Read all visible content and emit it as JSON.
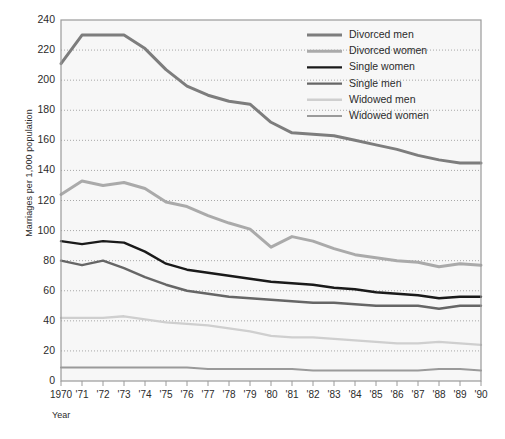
{
  "chart_data": {
    "type": "line",
    "title": "",
    "xlabel": "Year",
    "ylabel": "Marriages per 1,000 population",
    "grid": true,
    "legend_position": "top-right",
    "ylim": [
      0,
      240
    ],
    "ytick_step": 20,
    "yticks": [
      "240",
      "220",
      "200",
      "180",
      "160",
      "140",
      "120",
      "100",
      "80",
      "60",
      "40",
      "20",
      "0"
    ],
    "categories": [
      "1970",
      "'71",
      "'72",
      "'73",
      "'74",
      "'75",
      "'76",
      "'77",
      "'78",
      "'79",
      "'80",
      "'81",
      "'82",
      "'83",
      "'84",
      "'85",
      "'86",
      "'87",
      "'88",
      "'89",
      "'90"
    ],
    "x": [
      1970,
      1971,
      1972,
      1973,
      1974,
      1975,
      1976,
      1977,
      1978,
      1979,
      1980,
      1981,
      1982,
      1983,
      1984,
      1985,
      1986,
      1987,
      1988,
      1989,
      1990
    ],
    "series": [
      {
        "name": "Divorced men",
        "color": "#7d7d7d",
        "width": 3.0,
        "values": [
          211,
          230,
          230,
          230,
          221,
          207,
          196,
          190,
          186,
          184,
          172,
          165,
          164,
          163,
          160,
          157,
          154,
          150,
          147,
          145,
          145
        ]
      },
      {
        "name": "Divorced women",
        "color": "#aaaaaa",
        "width": 3.0,
        "values": [
          124,
          133,
          130,
          132,
          128,
          119,
          116,
          110,
          105,
          101,
          89,
          96,
          93,
          88,
          84,
          82,
          80,
          79,
          76,
          78,
          77
        ]
      },
      {
        "name": "Single women",
        "color": "#1a1a1a",
        "width": 2.4,
        "values": [
          93,
          91,
          93,
          92,
          86,
          78,
          74,
          72,
          70,
          68,
          66,
          65,
          64,
          62,
          61,
          59,
          58,
          57,
          55,
          56,
          56
        ]
      },
      {
        "name": "Single men",
        "color": "#666666",
        "width": 2.4,
        "values": [
          80,
          77,
          80,
          75,
          69,
          64,
          60,
          58,
          56,
          55,
          54,
          53,
          52,
          52,
          51,
          50,
          50,
          50,
          48,
          50,
          50
        ]
      },
      {
        "name": "Widowed men",
        "color": "#cfcfcf",
        "width": 2.4,
        "values": [
          42,
          42,
          42,
          43,
          41,
          39,
          38,
          37,
          35,
          33,
          30,
          29,
          29,
          28,
          27,
          26,
          25,
          25,
          26,
          25,
          24
        ]
      },
      {
        "name": "Widowed women",
        "color": "#9a9a9a",
        "width": 2.0,
        "values": [
          9,
          9,
          9,
          9,
          9,
          9,
          9,
          8,
          8,
          8,
          8,
          8,
          7,
          7,
          7,
          7,
          7,
          7,
          8,
          8,
          7
        ]
      }
    ]
  },
  "legend": {
    "items": [
      {
        "label": "Divorced men"
      },
      {
        "label": "Divorced women"
      },
      {
        "label": "Single women"
      },
      {
        "label": "Single men"
      },
      {
        "label": "Widowed men"
      },
      {
        "label": "Widowed women"
      }
    ]
  },
  "axes": {
    "y_title": "Marriages per 1,000 population",
    "x_title": "Year"
  },
  "style": {
    "plot_bg": "#f7f7f7",
    "frame_color": "#9a9a9a",
    "grid_color": "#a8a8a8",
    "text_color": "#2b2b2b"
  }
}
